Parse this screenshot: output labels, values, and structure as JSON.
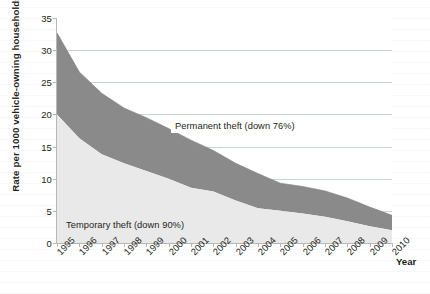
{
  "chart_data": {
    "type": "area",
    "stacked": true,
    "title": "",
    "subtitle": "",
    "xlabel": "Year",
    "ylabel": "Rate per 1000 vehicle-owning households",
    "x": [
      1995,
      1996,
      1997,
      1998,
      1999,
      2000,
      2001,
      2002,
      2003,
      2004,
      2005,
      2006,
      2007,
      2008,
      2009,
      2010
    ],
    "categories": [
      "1995",
      "1996",
      "1997",
      "1998",
      "1999",
      "2000",
      "2001",
      "2002",
      "2003",
      "2004",
      "2005",
      "2006",
      "2007",
      "2008",
      "2009",
      "2010"
    ],
    "series": [
      {
        "name": "Temporary theft (down 90%)",
        "color": "#e9e9e9",
        "values": [
          20.0,
          16.3,
          13.8,
          12.4,
          11.2,
          10.0,
          8.6,
          8.0,
          6.6,
          5.4,
          5.0,
          4.6,
          4.1,
          3.4,
          2.6,
          2.0
        ]
      },
      {
        "name": "Permanent theft (down 76%)",
        "color": "#8a8a8a",
        "values": [
          12.7,
          10.3,
          9.5,
          8.6,
          8.3,
          7.8,
          7.4,
          6.4,
          5.8,
          5.4,
          4.3,
          4.2,
          4.0,
          3.6,
          3.0,
          2.3
        ]
      }
    ],
    "totals": [
      32.7,
      26.6,
      23.3,
      21.0,
      19.5,
      17.8,
      16.0,
      14.4,
      12.4,
      10.8,
      9.3,
      8.8,
      8.1,
      7.0,
      5.6,
      4.3
    ],
    "ylim": [
      0,
      35
    ],
    "yticks": [
      0,
      5,
      10,
      15,
      20,
      25,
      30,
      35
    ],
    "ytick_labels": [
      "0",
      "5",
      "10",
      "15",
      "20",
      "25",
      "30",
      "35"
    ],
    "grid": "horizontal",
    "legend": "none",
    "annotations": [
      {
        "text": "Permanent theft (down 76%)",
        "target_series": "Permanent theft (down 76%)"
      },
      {
        "text": "Temporary theft (down 90%)",
        "target_series": "Temporary theft (down 90%)"
      }
    ]
  }
}
